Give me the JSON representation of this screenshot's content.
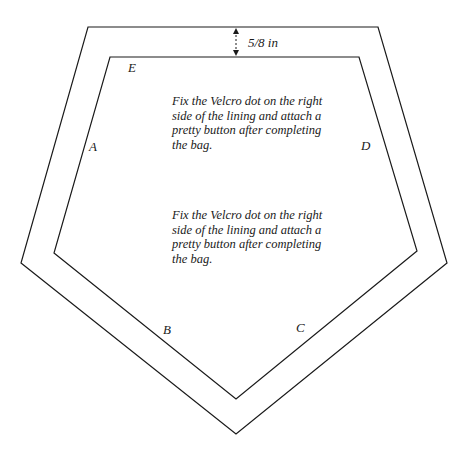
{
  "diagram": {
    "measurement_label": "5/8 in",
    "vertex_labels": {
      "A": "A",
      "B": "B",
      "C": "C",
      "D": "D",
      "E": "E"
    },
    "notes": [
      "Fix the Velcro dot on the right side of the lining and attach a pretty button after completing the bag.",
      "Fix the Velcro dot on the right side of the lining and attach a pretty button after completing the bag."
    ],
    "line_color": "#1a1a1a",
    "background_color": "#ffffff"
  }
}
